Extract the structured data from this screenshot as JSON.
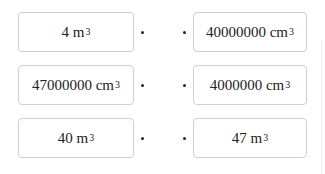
{
  "left_items": [
    {
      "value": "4",
      "unit": "m",
      "exp": "3"
    },
    {
      "value": "47000000",
      "unit": "cm",
      "exp": "3"
    },
    {
      "value": "40",
      "unit": "m",
      "exp": "3"
    }
  ],
  "right_items": [
    {
      "value": "40000000",
      "unit": "cm",
      "exp": "3"
    },
    {
      "value": "4000000",
      "unit": "cm",
      "exp": "3"
    },
    {
      "value": "47",
      "unit": "m",
      "exp": "3"
    }
  ]
}
